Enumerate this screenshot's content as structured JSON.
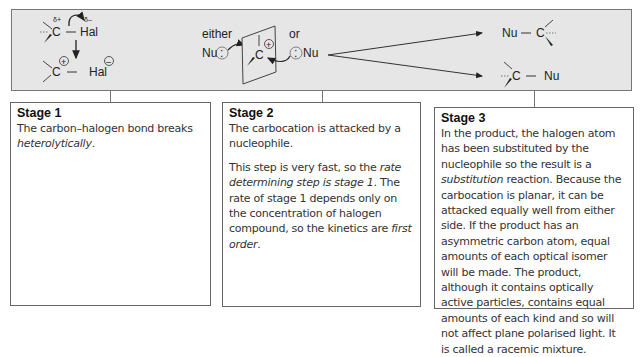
{
  "diagram": {
    "stage1_reaction": {
      "reactant_carbon": "C",
      "reactant_carbon_charge": "δ+",
      "reactant_halogen": "Hal",
      "reactant_halogen_charge": "δ–",
      "product_carbon": "C",
      "product_carbon_charge": "+",
      "product_halogen": "Hal",
      "product_halogen_charge": "–"
    },
    "stage2_reaction": {
      "left_label": "either",
      "right_label": "or",
      "nucleophile": "Nu",
      "lone_pair": ":",
      "carbon": "C",
      "carbon_charge": "+"
    },
    "stage3_reaction": {
      "product_top_nu": "Nu",
      "product_top_c": "C",
      "product_bottom_c": "C",
      "product_bottom_nu": "Nu"
    }
  },
  "stages": [
    {
      "title": "Stage 1",
      "paragraphs": [
        [
          {
            "t": "The carbon–halogen bond breaks "
          },
          {
            "t": "heterolytically",
            "i": true
          },
          {
            "t": "."
          }
        ]
      ]
    },
    {
      "title": "Stage 2",
      "paragraphs": [
        [
          {
            "t": "The carbocation is attacked by a nucleophile."
          }
        ],
        [
          {
            "t": "This step is very fast, so the "
          },
          {
            "t": "rate determining step is stage 1",
            "i": true
          },
          {
            "t": ". The rate of stage 1 depends only on the concentration of halogen compound, so the kinetics are "
          },
          {
            "t": "first order",
            "i": true
          },
          {
            "t": "."
          }
        ]
      ]
    },
    {
      "title": "Stage 3",
      "paragraphs": [
        [
          {
            "t": "In the product, the halogen atom has been substituted by the nucleophile so the result is a "
          },
          {
            "t": "substitution",
            "i": true
          },
          {
            "t": " reaction. Because the carbocation is planar, it can be attacked equally well from either side. If the product has an asymmetric carbon atom, equal amounts of each optical isomer will be made. The product, although it contains optically active particles, contains equal amounts of each kind and so will not affect plane polarised light. It is called a racemic mixture."
          }
        ]
      ]
    }
  ],
  "colors": {
    "panel_bg": "#e6e6e6",
    "border": "#666666",
    "text": "#333333"
  }
}
